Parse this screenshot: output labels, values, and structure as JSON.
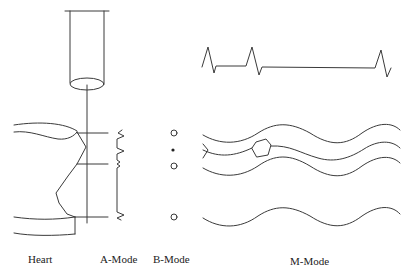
{
  "labels": {
    "heart": "Heart",
    "a_mode": "A-Mode",
    "b_mode": "B-Mode",
    "m_mode": "M-Mode"
  },
  "colors": {
    "stroke": "#3a3a3a",
    "background": "#ffffff"
  }
}
